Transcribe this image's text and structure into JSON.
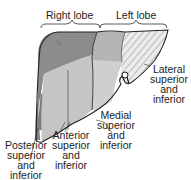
{
  "diagram": {
    "type": "anatomical-illustration",
    "headers": {
      "right_lobe": "Right lobe",
      "left_lobe": "Left lobe"
    },
    "labels": {
      "posterior": [
        "Posterior",
        "superior",
        "and",
        "inferior"
      ],
      "anterior": [
        "Anterior",
        "superior",
        "and",
        "inferior"
      ],
      "medial": [
        "Medial",
        "superior",
        "and",
        "inferior"
      ],
      "lateral": [
        "Lateral",
        "superior",
        "and",
        "inferior"
      ]
    },
    "colors": {
      "posterior_dark": "#8a8a8a",
      "anterior_mid": "#b0b0b0",
      "light": "#d2d2d2",
      "hatch": "#e8e8e8",
      "outline": "#222222"
    }
  }
}
